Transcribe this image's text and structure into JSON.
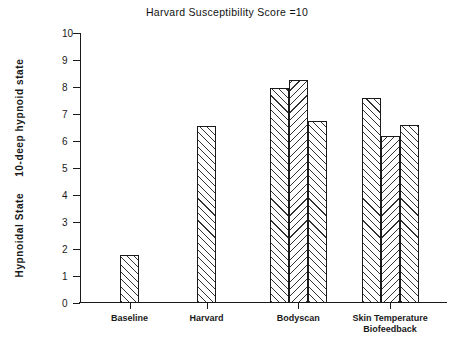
{
  "chart_data": {
    "type": "bar",
    "title": "Harvard Susceptibility Score =10",
    "xlabel": "",
    "ylabel_bold": "Hypnoidal State",
    "ylabel_scale": "10-deep hypnoid state",
    "ylim": [
      0,
      10
    ],
    "ytick_labels": [
      "10",
      "9",
      "8",
      "7",
      "6",
      "5",
      "4",
      "3",
      "2",
      "1",
      "0"
    ],
    "ytick_values": [
      10,
      9,
      8,
      7,
      6,
      5,
      4,
      3,
      2,
      1,
      0
    ],
    "grid": false,
    "legend": "none",
    "categories": [
      "Baseline",
      "Harvard",
      "Bodyscan",
      "Skin Temperature Biofeedback"
    ],
    "groups": [
      {
        "label": "Baseline",
        "label_line1": "Baseline",
        "label_line2": "",
        "bars": [
          {
            "value": 1.78,
            "hatch": "forward"
          }
        ]
      },
      {
        "label": "Harvard",
        "label_line1": "Harvard",
        "label_line2": "",
        "bars": [
          {
            "value": 6.55,
            "hatch": "forward"
          }
        ]
      },
      {
        "label": "Bodyscan",
        "label_line1": "Bodyscan",
        "label_line2": "",
        "bars": [
          {
            "value": 7.95,
            "hatch": "forward"
          },
          {
            "value": 8.25,
            "hatch": "backward"
          },
          {
            "value": 6.75,
            "hatch": "forward"
          }
        ]
      },
      {
        "label": "Skin Temperature Biofeedback",
        "label_line1": "Skin Temperature",
        "label_line2": "Biofeedback",
        "bars": [
          {
            "value": 7.6,
            "hatch": "forward"
          },
          {
            "value": 6.2,
            "hatch": "backward"
          },
          {
            "value": 6.6,
            "hatch": "forward"
          }
        ]
      }
    ],
    "colors": {
      "axis": "#1a1a1a",
      "bar_edge": "#1a1a1a",
      "bar_fill": "#ffffff",
      "hatch": "#333333",
      "background": "#ffffff"
    }
  }
}
